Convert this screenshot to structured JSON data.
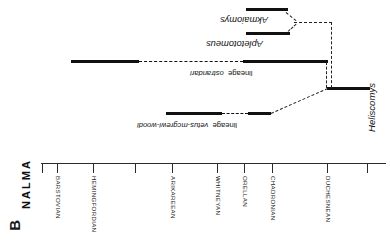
{
  "figure": {
    "panel_letter": "B",
    "axis_title": "NALMA",
    "heliscomys_label": "Heliscomys"
  },
  "axis": {
    "ticks": [
      {
        "label": "",
        "x": 42
      },
      {
        "label": "BARSTOVIAN",
        "x": 57
      },
      {
        "label": "HEMINGFORDIAN",
        "x": 93
      },
      {
        "label": "",
        "x": 135
      },
      {
        "label": "ARIKAREEAN",
        "x": 172
      },
      {
        "label": "WHITNEYAN",
        "x": 217
      },
      {
        "label": "ORELLAN",
        "x": 244
      },
      {
        "label": "CHADRONIAN",
        "x": 272
      },
      {
        "label": "DUCHESNEAN",
        "x": 327
      },
      {
        "label": "",
        "x": 367
      }
    ]
  },
  "taxa": [
    {
      "name": "Akmaiomys",
      "kind": "genus"
    },
    {
      "name": "Apletotomeus",
      "kind": "genus"
    },
    {
      "name": "ostrandari",
      "suffix": "lineage",
      "kind": "lineage"
    },
    {
      "name": "vetus-mcgrewi-woodi",
      "suffix": "lineage",
      "kind": "lineage"
    },
    {
      "name": "Heliscomys",
      "kind": "genus"
    }
  ],
  "chart_data": {
    "type": "line",
    "title": "B",
    "xlabel": "NALMA",
    "ylabel": "",
    "grid": false,
    "legend": "none",
    "x_ticks": [
      "",
      "BARSTOVIAN",
      "HEMINGFORDIAN",
      "",
      "ARIKAREEAN",
      "WHITNEYAN",
      "ORELLAN",
      "CHADRONIAN",
      "DUCHESNEAN",
      ""
    ],
    "x_tick_px": [
      42,
      57,
      93,
      135,
      172,
      217,
      244,
      272,
      327,
      367
    ],
    "series": [
      {
        "name": "Akmaiomys",
        "row_px": 8,
        "solid_ranges_px": [
          [
            246,
            288
          ]
        ],
        "dashed_ranges_px": []
      },
      {
        "name": "Apletotomeus",
        "row_px": 32,
        "solid_ranges_px": [
          [
            246,
            290
          ]
        ],
        "dashed_ranges_px": []
      },
      {
        "name": "ostrandari lineage",
        "row_px": 61,
        "solid_ranges_px": [
          [
            71,
            139
          ],
          [
            243,
            328
          ]
        ],
        "dashed_ranges_px": [
          [
            139,
            243
          ]
        ]
      },
      {
        "name": "vetus-mcgrewi-woodi lineage",
        "row_px": 113,
        "solid_ranges_px": [
          [
            166,
            222
          ],
          [
            248,
            271
          ]
        ],
        "dashed_ranges_px": [
          [
            222,
            248
          ]
        ]
      },
      {
        "name": "Heliscomys",
        "row_px": 88,
        "solid_ranges_px": [
          [
            327,
            370
          ]
        ],
        "dashed_ranges_px": []
      }
    ],
    "connectors_px": [
      {
        "from": "Heliscomys",
        "to": "vetus-mcgrewi-woodi lineage",
        "x1": 328,
        "y1": 88,
        "x2": 271,
        "y2": 113
      },
      {
        "from": "Heliscomys",
        "to": "ostrandari lineage",
        "x1": 328,
        "y1": 88,
        "x2": 327,
        "y2": 62
      },
      {
        "from": "ostrandari lineage",
        "to": "node",
        "x1": 330,
        "y1": 88,
        "x2": 330,
        "y2": 22
      },
      {
        "from": "node",
        "to": "Apletotomeus-Akmaiomys",
        "x1": 330,
        "y1": 22,
        "x2": 294,
        "y2": 22
      },
      {
        "from": "split",
        "to": "Akmaiomys",
        "x1": 294,
        "y1": 22,
        "x2": 286,
        "y2": 12
      },
      {
        "from": "split",
        "to": "Apletotomeus",
        "x1": 294,
        "y1": 22,
        "x2": 288,
        "y2": 31
      }
    ]
  }
}
